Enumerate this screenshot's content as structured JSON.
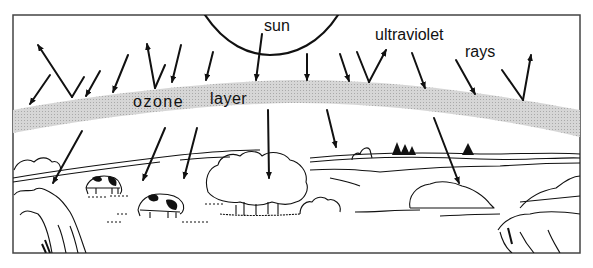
{
  "diagram": {
    "labels": {
      "sun": "sun",
      "ultraviolet": "ultraviolet",
      "rays": "rays",
      "ozone": "ozone",
      "layer": "layer"
    },
    "colors": {
      "ink": "#111111",
      "ozone_band": "#c8c8c8",
      "background": "#ffffff",
      "frame": "#444444"
    },
    "elements": [
      "sun",
      "ultraviolet rays (reflected and passing)",
      "ozone layer band",
      "hills",
      "trees",
      "bushes",
      "cows",
      "pine trees"
    ]
  }
}
